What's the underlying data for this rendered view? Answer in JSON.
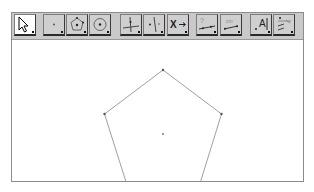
{
  "toolbar": {
    "tools": [
      {
        "name": "move-tool",
        "icon": "cursor-arrow-icon",
        "selected": true
      },
      {
        "name": "point-tool",
        "icon": "point-icon",
        "selected": false
      },
      {
        "name": "regular-polygon-tool",
        "icon": "pentagon-icon",
        "selected": false
      },
      {
        "name": "circle-tool",
        "icon": "circle-center-icon",
        "selected": false
      },
      {
        "name": "perpendicular-line-tool",
        "icon": "perpendicular-line-icon",
        "selected": false
      },
      {
        "name": "angle-bisector-tool",
        "icon": "bisector-icon",
        "selected": false
      },
      {
        "name": "reflect-tool",
        "icon": "reflect-x-arrow-icon",
        "selected": false,
        "label": "X"
      },
      {
        "name": "relation-tool",
        "icon": "question-segment-icon",
        "selected": false,
        "label": "?"
      },
      {
        "name": "distance-tool",
        "icon": "distance-cm-icon",
        "selected": false,
        "label": "cm"
      },
      {
        "name": "text-tool",
        "icon": "text-a-icon",
        "selected": false,
        "label": "A"
      },
      {
        "name": "slider-tool",
        "icon": "slider-icon",
        "selected": false
      }
    ]
  },
  "canvas": {
    "shape": "regular-pentagon",
    "vertices": [
      [
        151,
        30
      ],
      [
        209.5,
        74
      ],
      [
        187.5,
        145
      ],
      [
        115,
        145
      ],
      [
        92.5,
        74
      ]
    ],
    "center": [
      151,
      94
    ],
    "stroke": "#9a9a9a",
    "point_color": "#555555"
  }
}
